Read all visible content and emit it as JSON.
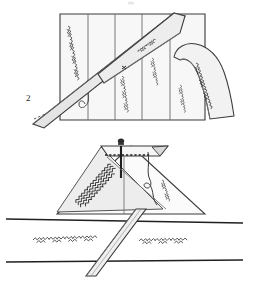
{
  "figure": {
    "kind": "technical-line-illustration",
    "caption_number": "2",
    "background_color": "#ffffff",
    "ink_color": "#3a3a3a",
    "stitch_color": "#2b2b2b",
    "fabric_fill": "#efefef",
    "fabric_fill_dark": "#e2e2e2",
    "panels": [
      {
        "name": "upper-scene",
        "description": "pleated fabric block with folded-back flap and diagonal bias strip"
      },
      {
        "name": "middle-scene",
        "description": "triangular mitred corner pinned with a straight pin and looped thread"
      },
      {
        "name": "lower-scene",
        "description": "two parallel seam lines with zigzag stitching and a diagonal strip crossing"
      }
    ],
    "stitch_marks": [
      {
        "id": "stitch-upper-left",
        "label": "zigzag stitching on left panel"
      },
      {
        "id": "stitch-upper-strip",
        "label": "stitching on diagonal bias strip"
      },
      {
        "id": "stitch-upper-mid-a",
        "label": "zigzag stitching on centre panel"
      },
      {
        "id": "stitch-upper-mid-b",
        "label": "zigzag stitching on third panel"
      },
      {
        "id": "stitch-upper-right",
        "label": "zigzag stitching on right panel"
      },
      {
        "id": "stitch-upper-flap",
        "label": "zigzag stitching on folded flap"
      },
      {
        "id": "stitch-mid-triangle",
        "label": "dense zigzag stitching inside mitre"
      },
      {
        "id": "stitch-mid-thread-tail",
        "label": "short stitch run beside thread loop"
      },
      {
        "id": "stitch-lower-left",
        "label": "zigzag stitching left of crossing strip"
      },
      {
        "id": "stitch-lower-right",
        "label": "zigzag stitching right of crossing strip"
      }
    ],
    "annotations": {
      "pin_head": "pin head",
      "pin_shaft": "pin shaft",
      "basting_line": "dashed basting line",
      "thread_loop": "loose thread loop"
    }
  }
}
